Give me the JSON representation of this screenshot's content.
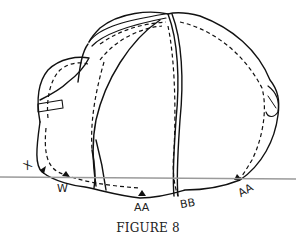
{
  "figure": {
    "caption": "FIGURE 8",
    "labels": {
      "x": "X",
      "w": "W",
      "aa_center": "AA",
      "bb": "BB",
      "aa_right": "AA"
    },
    "colors": {
      "line": "#111111",
      "rule": "#9a9a9a",
      "background": "#ffffff"
    }
  }
}
